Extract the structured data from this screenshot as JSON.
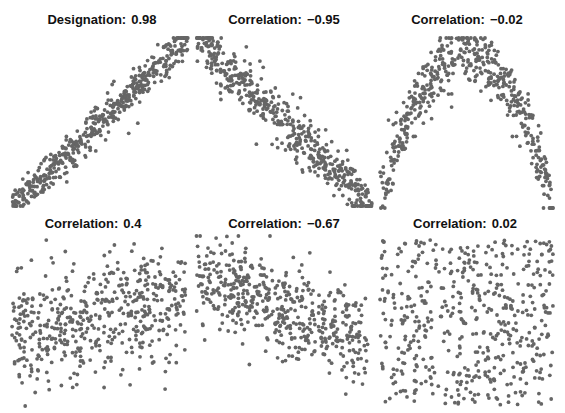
{
  "chart_data": {
    "type": "scatter",
    "title": "",
    "point_color": "#666666",
    "panels": [
      {
        "title_label": "Designation:",
        "title_value": "0.98",
        "correlation": 0.98,
        "pattern": "linear-positive-strong",
        "n_points": 500,
        "xlim": [
          0,
          1
        ],
        "ylim": [
          0,
          1
        ]
      },
      {
        "title_label": "Correlation:",
        "title_value": "−0.95",
        "correlation": -0.95,
        "pattern": "linear-negative-strong",
        "n_points": 500,
        "xlim": [
          0,
          1
        ],
        "ylim": [
          0,
          1
        ]
      },
      {
        "title_label": "Correlation:",
        "title_value": "−0.02",
        "correlation": -0.02,
        "pattern": "inverted-parabola",
        "n_points": 500,
        "xlim": [
          0,
          1
        ],
        "ylim": [
          0,
          1
        ]
      },
      {
        "title_label": "Correlation:",
        "title_value": "0.4",
        "correlation": 0.4,
        "pattern": "linear-positive-weak",
        "n_points": 500,
        "xlim": [
          0,
          1
        ],
        "ylim": [
          0,
          1
        ]
      },
      {
        "title_label": "Correlation:",
        "title_value": "−0.67",
        "correlation": -0.67,
        "pattern": "linear-negative-moderate",
        "n_points": 500,
        "xlim": [
          0,
          1
        ],
        "ylim": [
          0,
          1
        ]
      },
      {
        "title_label": "Correlation:",
        "title_value": "0.02",
        "correlation": 0.02,
        "pattern": "uniform-random",
        "n_points": 500,
        "xlim": [
          0,
          1
        ],
        "ylim": [
          0,
          1
        ]
      }
    ]
  }
}
